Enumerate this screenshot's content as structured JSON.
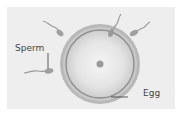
{
  "diagram": {
    "labels": {
      "sperm": "Sperm",
      "egg": "Egg"
    },
    "colors": {
      "background": "#ffffff",
      "panel": "#eeeeee",
      "egg_outer_ring": "#a6a6a6",
      "egg_inner_ring": "#8c8c8c",
      "egg_cytoplasm": "#e2e2e2",
      "nucleus": "#9a9a9a",
      "sperm": "#9a9a9a",
      "leader_line": "#333333",
      "text": "#444444"
    },
    "elements": [
      "egg",
      "nucleus",
      "sperm-1",
      "sperm-2",
      "sperm-3",
      "sperm-4"
    ]
  }
}
